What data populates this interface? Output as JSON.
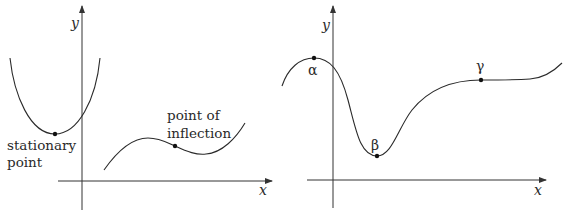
{
  "diagrams": [
    {
      "id": "left",
      "axes": {
        "x_label": "x",
        "y_label": "y"
      },
      "curves": [
        {
          "name": "parabola",
          "description": "U-shaped curve with minimum"
        },
        {
          "name": "cubic",
          "description": "S-shaped curve with local max, inflection, local min"
        }
      ],
      "annotations": {
        "stationary_line1": "stationary",
        "stationary_line2": "point",
        "inflection_line1": "point of",
        "inflection_line2": "inflection"
      }
    },
    {
      "id": "right",
      "axes": {
        "x_label": "x",
        "y_label": "y"
      },
      "points": [
        {
          "label": "α",
          "type": "local maximum"
        },
        {
          "label": "β",
          "type": "local minimum"
        },
        {
          "label": "γ",
          "type": "stationary point of inflection"
        }
      ]
    }
  ],
  "colors": {
    "line": "#2a2a2a",
    "background": "#ffffff"
  }
}
